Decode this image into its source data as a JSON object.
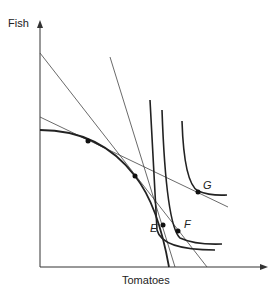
{
  "axes": {
    "y_label": "Fish",
    "x_label": "Tomatoes"
  },
  "points": {
    "E": "E",
    "F": "F",
    "G": "G"
  },
  "colors": {
    "line": "#333333",
    "curve": "#222222"
  }
}
